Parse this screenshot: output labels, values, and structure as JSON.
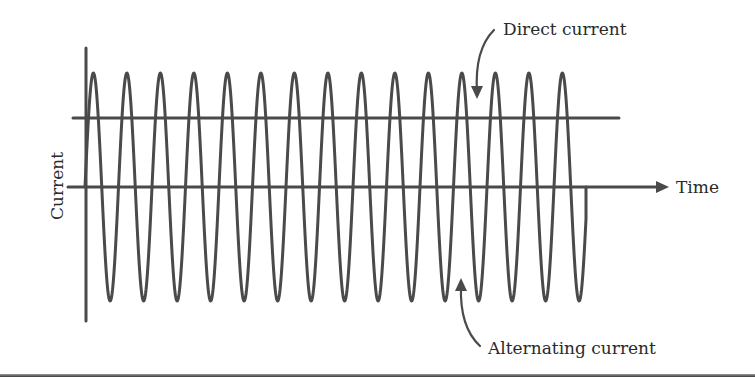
{
  "diagram": {
    "title": "",
    "y_axis_label": "Current",
    "x_axis_label": "Time",
    "annotations": {
      "dc_label": "Direct current",
      "ac_label": "Alternating current"
    },
    "colors": {
      "line": "#4a4a4a",
      "text": "#2a2a2a",
      "background": "#ffffff"
    },
    "waveform": {
      "type": "sine",
      "cycles": 15,
      "start_x": 85,
      "period_px": 33.5,
      "baseline_y": 187,
      "amplitude_px": 114,
      "end_x": 586
    },
    "dc_line": {
      "x1": 73,
      "x2": 619,
      "y": 118
    },
    "time_axis": {
      "x1": 68,
      "x2": 668,
      "y": 187
    },
    "current_axis": {
      "x": 85,
      "y1": 48,
      "y2": 321
    }
  }
}
